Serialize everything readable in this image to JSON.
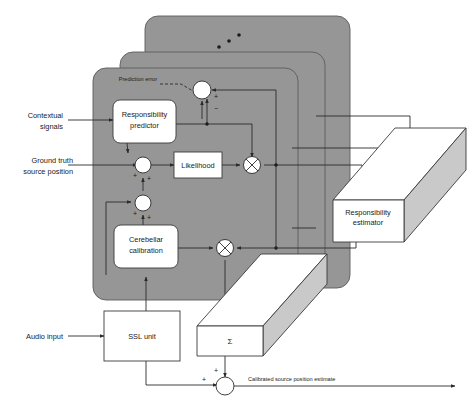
{
  "figure": {
    "type": "block-diagram",
    "background_color": "#ffffff",
    "panel_color": "#969696",
    "line_color": "#2b2b2b"
  },
  "layers": {
    "count": 3,
    "repetition_indicator": "diagonal-dots",
    "dots": 3
  },
  "external_inputs": [
    {
      "id": "contextual",
      "label": "Contextual signals",
      "line1": "Contextual",
      "line2": "signals"
    },
    {
      "id": "ground_truth",
      "label": "Ground truth source position",
      "line1": "Ground truth",
      "line2": "source position"
    },
    {
      "id": "audio",
      "label": "Audio input",
      "line1": "Audio input",
      "line2": ""
    }
  ],
  "outputs": [
    {
      "id": "calibrated",
      "label": "Calibrated source position estimate"
    }
  ],
  "blocks": [
    {
      "id": "responsibility-predictor",
      "line1": "Responsibility",
      "line2": "predictor",
      "shape": "rounded-rect",
      "fill": "#ffffff"
    },
    {
      "id": "likelihood",
      "line1": "Likelihood",
      "line2": "",
      "shape": "rect",
      "fill": "#ffffff"
    },
    {
      "id": "cerebellar-calibration",
      "line1": "Cerebellar",
      "line2": "calibration",
      "shape": "rounded-rect",
      "fill": "#ffffff"
    },
    {
      "id": "ssl-unit",
      "line1": "SSL unit",
      "line2": "",
      "shape": "rect",
      "fill": "#ffffff"
    },
    {
      "id": "responsibility-estimator",
      "line1": "Responsibility",
      "line2": "estimator",
      "shape": "slab-3d",
      "fill": "#ffffff"
    },
    {
      "id": "summation-slab",
      "line1": "Σ",
      "line2": "",
      "shape": "slab-3d",
      "fill": "#ffffff"
    }
  ],
  "annotations": {
    "prediction_error": "Prediction error"
  },
  "signs": {
    "plus": "+",
    "minus": "−"
  },
  "operators": {
    "multiply": "⊗",
    "sum": "Σ"
  }
}
